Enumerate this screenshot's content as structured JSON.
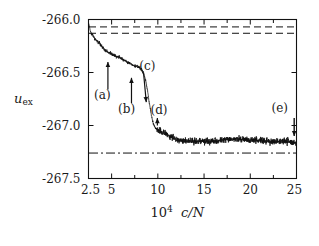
{
  "figure": {
    "width": 318,
    "height": 246,
    "background": "#ffffff",
    "line_color": "#111111"
  },
  "axis_titles": {
    "y_main": "u",
    "y_sub": "ex",
    "x_prefix": "10",
    "x_exp": "4",
    "x_var": "c/N"
  },
  "ticks": {
    "y_labels": [
      "-266.0",
      "-266.5",
      "-267.0",
      "-267.5"
    ],
    "x_labels": [
      "2.5",
      "5",
      "10",
      "15",
      "20",
      "25"
    ]
  },
  "annotations": [
    {
      "label": "(a)",
      "x": 4.6,
      "text_x": 4.4,
      "text_y": -266.72
    },
    {
      "label": "(b)",
      "x": 7.1,
      "text_x": 7.0,
      "text_y": -266.85
    },
    {
      "label": "(c)",
      "x": 8.7,
      "text_x": 9.3,
      "text_y": -266.45
    },
    {
      "label": "(d)",
      "x": 9.9,
      "text_x": 10.5,
      "text_y": -266.86
    },
    {
      "label": "(e)",
      "x": 24.7,
      "text_x": 23.6,
      "text_y": -266.84
    }
  ],
  "chart_data": {
    "type": "line",
    "title": "",
    "xlabel": "10^4 c/N",
    "ylabel": "u_ex",
    "xlim": [
      2.5,
      25
    ],
    "ylim": [
      -267.5,
      -266.0
    ],
    "xticks": [
      2.5,
      5,
      10,
      15,
      20,
      25
    ],
    "yticks": [
      -266.0,
      -266.5,
      -267.0,
      -267.5
    ],
    "grid": false,
    "legend": null,
    "series": [
      {
        "name": "u_ex running average (noisy MC trace)",
        "style": "solid",
        "description": "Starts near -266.03 at c/N=2.5, decays with noise through plateaus to about -266.45 near 8, drops steeply to about -267.02 by 10, then settles around -267.13 to -267.16 for the remainder out to 25.",
        "x": [
          2.5,
          2.7,
          2.9,
          3.1,
          3.3,
          3.5,
          3.7,
          3.9,
          4.1,
          4.3,
          4.5,
          4.7,
          4.9,
          5.1,
          5.3,
          5.5,
          5.7,
          5.9,
          6.1,
          6.3,
          6.5,
          6.7,
          6.9,
          7.1,
          7.3,
          7.5,
          7.7,
          7.9,
          8.1,
          8.3,
          8.5,
          8.7,
          8.9,
          9.1,
          9.3,
          9.5,
          9.7,
          9.9,
          10.1,
          10.5,
          11.0,
          11.5,
          12.0,
          12.5,
          13.0,
          14.0,
          15.0,
          16.0,
          17.0,
          18.0,
          19.0,
          20.0,
          21.0,
          22.0,
          23.0,
          24.0,
          24.8
        ],
        "y": [
          -266.03,
          -266.11,
          -266.14,
          -266.17,
          -266.19,
          -266.21,
          -266.23,
          -266.25,
          -266.27,
          -266.29,
          -266.3,
          -266.31,
          -266.32,
          -266.33,
          -266.34,
          -266.35,
          -266.35,
          -266.36,
          -266.37,
          -266.38,
          -266.39,
          -266.4,
          -266.41,
          -266.42,
          -266.43,
          -266.44,
          -266.44,
          -266.45,
          -266.46,
          -266.48,
          -266.52,
          -266.58,
          -266.68,
          -266.8,
          -266.9,
          -266.98,
          -267.02,
          -267.04,
          -267.05,
          -267.06,
          -267.08,
          -267.11,
          -267.13,
          -267.14,
          -267.14,
          -267.15,
          -267.15,
          -267.15,
          -267.14,
          -267.13,
          -267.13,
          -267.14,
          -267.14,
          -267.15,
          -267.15,
          -267.15,
          -267.16
        ]
      }
    ],
    "reference_lines": [
      {
        "name": "upper-dashed",
        "style": "dashed",
        "y": -266.07
      },
      {
        "name": "lower-dashed",
        "style": "dashed",
        "y": -266.13
      },
      {
        "name": "dash-dot-asymptote",
        "style": "dashdot",
        "y": -267.26
      }
    ]
  }
}
